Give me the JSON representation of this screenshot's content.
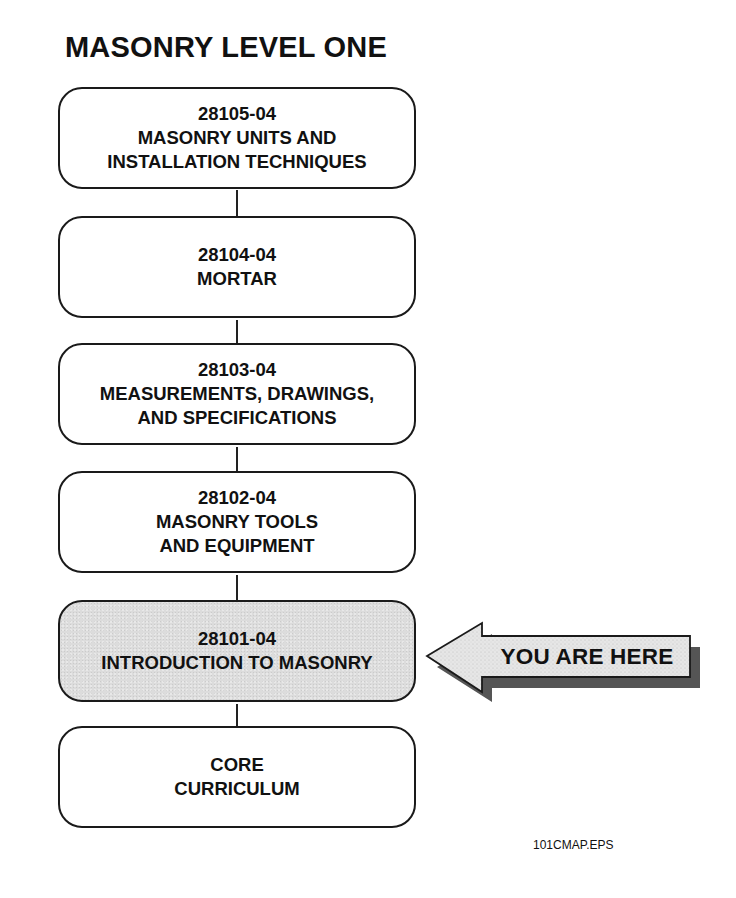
{
  "title": "MASONRY LEVEL ONE",
  "modules": [
    {
      "code": "28105-04",
      "lines": [
        "MASONRY UNITS AND",
        "INSTALLATION TECHNIQUES"
      ],
      "current": false
    },
    {
      "code": "28104-04",
      "lines": [
        "MORTAR"
      ],
      "current": false
    },
    {
      "code": "28103-04",
      "lines": [
        "MEASUREMENTS, DRAWINGS,",
        "AND SPECIFICATIONS"
      ],
      "current": false
    },
    {
      "code": "28102-04",
      "lines": [
        "MASONRY TOOLS",
        "AND EQUIPMENT"
      ],
      "current": false
    },
    {
      "code": "28101-04",
      "lines": [
        "INTRODUCTION TO MASONRY"
      ],
      "current": true
    },
    {
      "code": "",
      "lines": [
        "CORE",
        "CURRICULUM"
      ],
      "current": false
    }
  ],
  "indicator": {
    "label": "YOU ARE HERE",
    "points_to": "28101-04",
    "icon": "left-arrow-icon"
  },
  "file_label": "101CMAP.EPS",
  "colors": {
    "current_fill": "#dcdcdc",
    "arrow_fill": "#e6e6e6",
    "outline": "#1a1a1a",
    "shadow": "#555555"
  }
}
